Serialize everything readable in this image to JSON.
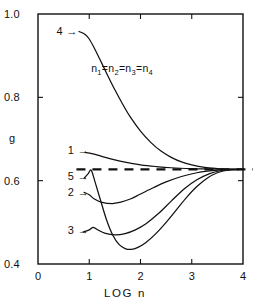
{
  "chart_data": {
    "type": "line",
    "title": "",
    "xlabel": "LOG n",
    "ylabel": "g",
    "xlim": [
      0,
      4
    ],
    "ylim": [
      0.4,
      1.0
    ],
    "xticks": [
      "0",
      "1",
      "2",
      "3",
      "4"
    ],
    "xtick_values": [
      0,
      1,
      2,
      3,
      4
    ],
    "yticks": [
      "1.0",
      "0.8",
      "0.6",
      "0.4"
    ],
    "ytick_values": [
      1.0,
      0.8,
      0.6,
      0.4
    ],
    "grid": false,
    "legend": "none",
    "annotations": [
      {
        "name": "equal-populations-note",
        "text": "n₁=n₂=n₃=n₄",
        "parts": [
          "n",
          "1",
          "=n",
          "2",
          "=n",
          "3",
          "=n",
          "4"
        ],
        "x": 1.78,
        "y": 0.868
      }
    ],
    "reference_line": {
      "name": "asymptote",
      "style": "dashed",
      "orientation": "horizontal",
      "y": 0.627,
      "x_start": 0.75,
      "x_end": 4.0
    },
    "series": [
      {
        "name": "curve-1",
        "label": "1",
        "label_x": 0.62,
        "label_y": 0.672,
        "points": [
          [
            0.92,
            0.668
          ],
          [
            1.05,
            0.665
          ],
          [
            1.2,
            0.66
          ],
          [
            1.4,
            0.653
          ],
          [
            1.6,
            0.647
          ],
          [
            1.8,
            0.642
          ],
          [
            2.0,
            0.638
          ],
          [
            2.3,
            0.634
          ],
          [
            2.6,
            0.631
          ],
          [
            3.0,
            0.629
          ],
          [
            3.4,
            0.628
          ],
          [
            3.7,
            0.627
          ],
          [
            4.0,
            0.627
          ]
        ]
      },
      {
        "name": "curve-2",
        "label": "2",
        "label_x": 0.62,
        "label_y": 0.57,
        "points": [
          [
            0.9,
            0.572
          ],
          [
            1.0,
            0.566
          ],
          [
            1.1,
            0.556
          ],
          [
            1.25,
            0.548
          ],
          [
            1.45,
            0.545
          ],
          [
            1.6,
            0.548
          ],
          [
            1.8,
            0.556
          ],
          [
            2.0,
            0.568
          ],
          [
            2.25,
            0.583
          ],
          [
            2.5,
            0.597
          ],
          [
            2.8,
            0.61
          ],
          [
            3.1,
            0.619
          ],
          [
            3.4,
            0.624
          ],
          [
            3.7,
            0.627
          ],
          [
            4.0,
            0.627
          ]
        ]
      },
      {
        "name": "curve-3",
        "label": "3",
        "label_x": 0.62,
        "label_y": 0.48,
        "points": [
          [
            0.88,
            0.477
          ],
          [
            1.0,
            0.482
          ],
          [
            1.08,
            0.488
          ],
          [
            1.18,
            0.481
          ],
          [
            1.3,
            0.474
          ],
          [
            1.5,
            0.47
          ],
          [
            1.7,
            0.473
          ],
          [
            1.9,
            0.482
          ],
          [
            2.1,
            0.496
          ],
          [
            2.35,
            0.521
          ],
          [
            2.6,
            0.551
          ],
          [
            2.85,
            0.58
          ],
          [
            3.1,
            0.602
          ],
          [
            3.35,
            0.617
          ],
          [
            3.6,
            0.625
          ],
          [
            3.8,
            0.627
          ],
          [
            4.0,
            0.627
          ]
        ]
      },
      {
        "name": "curve-4",
        "label": "4",
        "label_x": 0.4,
        "label_y": 0.958,
        "points": [
          [
            0.8,
            0.958
          ],
          [
            0.92,
            0.951
          ],
          [
            1.0,
            0.94
          ],
          [
            1.1,
            0.918
          ],
          [
            1.2,
            0.893
          ],
          [
            1.35,
            0.855
          ],
          [
            1.5,
            0.818
          ],
          [
            1.65,
            0.784
          ],
          [
            1.8,
            0.753
          ],
          [
            2.0,
            0.719
          ],
          [
            2.2,
            0.692
          ],
          [
            2.4,
            0.671
          ],
          [
            2.6,
            0.656
          ],
          [
            2.8,
            0.645
          ],
          [
            3.0,
            0.638
          ],
          [
            3.25,
            0.632
          ],
          [
            3.5,
            0.629
          ],
          [
            3.75,
            0.627
          ],
          [
            4.0,
            0.627
          ]
        ]
      },
      {
        "name": "curve-5",
        "label": "5",
        "label_x": 0.62,
        "label_y": 0.608,
        "points": [
          [
            0.9,
            0.606
          ],
          [
            0.98,
            0.617
          ],
          [
            1.04,
            0.625
          ],
          [
            1.12,
            0.594
          ],
          [
            1.22,
            0.553
          ],
          [
            1.34,
            0.505
          ],
          [
            1.46,
            0.469
          ],
          [
            1.58,
            0.447
          ],
          [
            1.7,
            0.437
          ],
          [
            1.82,
            0.435
          ],
          [
            1.95,
            0.44
          ],
          [
            2.1,
            0.451
          ],
          [
            2.3,
            0.473
          ],
          [
            2.5,
            0.5
          ],
          [
            2.7,
            0.53
          ],
          [
            2.9,
            0.56
          ],
          [
            3.1,
            0.586
          ],
          [
            3.3,
            0.606
          ],
          [
            3.5,
            0.619
          ],
          [
            3.7,
            0.625
          ],
          [
            4.0,
            0.627
          ]
        ]
      }
    ]
  },
  "labels": {
    "y_axis": "g",
    "x_axis": "LOG n",
    "arrow": "→"
  }
}
